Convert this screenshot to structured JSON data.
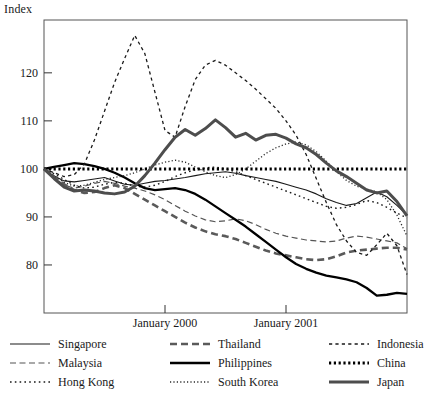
{
  "title_label": "Index",
  "chart_data": {
    "type": "line",
    "title": "Index",
    "xlabel": "",
    "ylabel": "Index",
    "ylim": [
      70,
      131
    ],
    "yticks": [
      80,
      90,
      100,
      110,
      120
    ],
    "xlim": [
      0,
      36
    ],
    "xticks": [
      12,
      24
    ],
    "xticklabels": [
      "January 2000",
      "January 2001"
    ],
    "grid": false,
    "legend_position": "below",
    "x": [
      0,
      1,
      2,
      3,
      4,
      5,
      6,
      7,
      8,
      9,
      10,
      11,
      12,
      13,
      14,
      15,
      16,
      17,
      18,
      19,
      20,
      21,
      22,
      23,
      24,
      25,
      26,
      27,
      28,
      29,
      30,
      31,
      32,
      33,
      34,
      35,
      36
    ],
    "series": [
      {
        "name": "Singapore",
        "style": "thin-solid",
        "color": "#1a1a1a",
        "values": [
          100,
          98.5,
          97.5,
          97.3,
          97.6,
          97.9,
          98.2,
          97.5,
          96.8,
          96.6,
          97.0,
          97.4,
          97.6,
          97.9,
          98.2,
          98.6,
          99.0,
          99.2,
          99.4,
          99.1,
          98.6,
          98.2,
          97.8,
          97.4,
          96.8,
          96.2,
          95.6,
          94.8,
          93.8,
          93.0,
          92.4,
          92.8,
          94.0,
          95.2,
          94.2,
          92.4,
          90.4
        ]
      },
      {
        "name": "Malaysia",
        "style": "thin-dashed",
        "color": "#555555",
        "values": [
          100,
          98.2,
          96.6,
          96.0,
          96.4,
          97.0,
          97.4,
          97.0,
          96.4,
          96.0,
          95.4,
          94.6,
          93.6,
          92.4,
          91.2,
          90.2,
          89.4,
          89.0,
          89.2,
          89.6,
          89.2,
          88.4,
          87.4,
          86.6,
          86.0,
          85.6,
          85.2,
          85.0,
          84.8,
          85.0,
          85.6,
          86.0,
          85.8,
          85.4,
          85.0,
          84.6,
          83.4
        ]
      },
      {
        "name": "Hong Kong",
        "style": "thin-dotted-coarse",
        "color": "#1a1a1a",
        "values": [
          100,
          99.0,
          97.8,
          96.6,
          96.0,
          96.2,
          96.8,
          97.2,
          97.0,
          96.4,
          96.2,
          96.6,
          97.4,
          98.4,
          99.2,
          99.8,
          100.2,
          100.4,
          100.0,
          99.4,
          98.6,
          97.8,
          97.0,
          96.2,
          95.4,
          94.6,
          93.8,
          93.0,
          92.2,
          91.8,
          92.0,
          92.6,
          93.4,
          93.0,
          92.0,
          90.8,
          89.8
        ]
      },
      {
        "name": "Thailand",
        "style": "thick-dashed",
        "color": "#5a5a5a",
        "values": [
          100,
          98.4,
          96.8,
          95.6,
          95.0,
          95.2,
          96.0,
          96.6,
          96.0,
          94.8,
          93.6,
          92.4,
          91.2,
          90.0,
          88.8,
          87.8,
          87.0,
          86.4,
          86.0,
          85.4,
          84.6,
          83.8,
          83.0,
          82.4,
          82.0,
          81.6,
          81.2,
          81.0,
          81.2,
          81.8,
          82.6,
          83.0,
          83.2,
          83.4,
          83.6,
          83.6,
          83.2
        ]
      },
      {
        "name": "Philippines",
        "style": "thick-solid-black",
        "color": "#000000",
        "values": [
          100,
          100.4,
          100.8,
          101.2,
          101.0,
          100.6,
          100.0,
          99.2,
          98.2,
          97.0,
          96.0,
          95.6,
          95.8,
          96.0,
          95.6,
          94.8,
          93.6,
          92.2,
          90.8,
          89.4,
          88.0,
          86.4,
          84.8,
          83.2,
          81.6,
          80.2,
          79.2,
          78.4,
          77.8,
          77.4,
          77.0,
          76.4,
          75.2,
          73.6,
          73.8,
          74.2,
          74.0
        ]
      },
      {
        "name": "South Korea",
        "style": "fine-dotted",
        "color": "#2b2b2b",
        "values": [
          100,
          98.6,
          97.2,
          96.4,
          96.6,
          97.2,
          97.8,
          98.2,
          98.6,
          99.2,
          100.0,
          100.8,
          101.4,
          101.8,
          101.4,
          100.4,
          99.4,
          98.6,
          98.2,
          98.8,
          100.0,
          101.6,
          103.2,
          104.4,
          105.2,
          105.6,
          105.0,
          103.6,
          101.6,
          99.4,
          97.6,
          96.4,
          95.8,
          95.2,
          93.6,
          90.4,
          86.0
        ]
      },
      {
        "name": "Indonesia",
        "style": "thin-longdash",
        "color": "#1a1a1a",
        "values": [
          100,
          99.2,
          98.4,
          98.8,
          101.0,
          106.0,
          112.0,
          118.0,
          123.0,
          127.8,
          124.0,
          116.0,
          108.0,
          106.6,
          113.0,
          118.6,
          121.6,
          122.6,
          121.6,
          120.0,
          118.4,
          116.6,
          114.6,
          112.6,
          110.0,
          107.0,
          103.0,
          98.0,
          93.0,
          88.4,
          85.0,
          82.6,
          82.0,
          84.2,
          86.6,
          84.0,
          78.0
        ]
      },
      {
        "name": "China",
        "style": "thick-dotted",
        "color": "#000000",
        "values": [
          100,
          100,
          100,
          100,
          100,
          100,
          100,
          100,
          100,
          100,
          100,
          100,
          100,
          100,
          100,
          100,
          100,
          100,
          100,
          100,
          100,
          100,
          100,
          100,
          100,
          100,
          100,
          100,
          100,
          100,
          100,
          100,
          100,
          100,
          100,
          100,
          100
        ]
      },
      {
        "name": "Japan",
        "style": "thick-solid-gray",
        "color": "#4d4d4d",
        "values": [
          100,
          98.0,
          96.2,
          95.4,
          95.6,
          95.4,
          95.0,
          94.8,
          95.2,
          96.4,
          98.6,
          101.2,
          104.0,
          106.6,
          108.2,
          107.0,
          108.4,
          110.2,
          108.6,
          106.6,
          107.4,
          106.0,
          107.0,
          107.2,
          106.4,
          105.2,
          104.4,
          103.0,
          101.2,
          99.6,
          98.4,
          97.0,
          95.6,
          95.0,
          95.4,
          93.2,
          90.2
        ]
      }
    ]
  },
  "legend": {
    "columns": [
      [
        {
          "label": "Singapore",
          "key": "thin-solid"
        },
        {
          "label": "Malaysia",
          "key": "thin-dashed"
        },
        {
          "label": "Hong Kong",
          "key": "thin-dotted-coarse"
        }
      ],
      [
        {
          "label": "Thailand",
          "key": "thick-dashed"
        },
        {
          "label": "Philippines",
          "key": "thick-solid-black"
        },
        {
          "label": "South Korea",
          "key": "fine-dotted"
        }
      ],
      [
        {
          "label": "Indonesia",
          "key": "thin-longdash"
        },
        {
          "label": "China",
          "key": "thick-dotted"
        },
        {
          "label": "Japan",
          "key": "thick-solid-gray"
        }
      ]
    ]
  }
}
